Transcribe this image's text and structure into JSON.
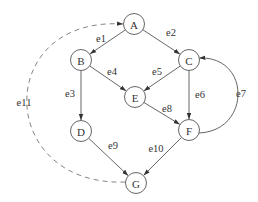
{
  "diagram": {
    "type": "directed-graph",
    "nodes": [
      {
        "id": "A",
        "label": "A",
        "x": 134,
        "y": 24
      },
      {
        "id": "B",
        "label": "B",
        "x": 81,
        "y": 60
      },
      {
        "id": "C",
        "label": "C",
        "x": 189,
        "y": 60
      },
      {
        "id": "E",
        "label": "E",
        "x": 135,
        "y": 97
      },
      {
        "id": "D",
        "label": "D",
        "x": 81,
        "y": 131
      },
      {
        "id": "F",
        "label": "F",
        "x": 189,
        "y": 130
      },
      {
        "id": "G",
        "label": "G",
        "x": 136,
        "y": 183
      }
    ],
    "edges": [
      {
        "id": "e1",
        "label": "e1",
        "from": "A",
        "to": "B",
        "style": "solid",
        "label_x": 101,
        "label_y": 38
      },
      {
        "id": "e2",
        "label": "e2",
        "from": "A",
        "to": "C",
        "style": "solid",
        "label_x": 171,
        "label_y": 32
      },
      {
        "id": "e3",
        "label": "e3",
        "from": "B",
        "to": "D",
        "style": "solid",
        "label_x": 70,
        "label_y": 93
      },
      {
        "id": "e4",
        "label": "e4",
        "from": "B",
        "to": "E",
        "style": "solid",
        "label_x": 112,
        "label_y": 71
      },
      {
        "id": "e5",
        "label": "e5",
        "from": "C",
        "to": "E",
        "style": "solid",
        "label_x": 157,
        "label_y": 71
      },
      {
        "id": "e6",
        "label": "e6",
        "from": "C",
        "to": "F",
        "style": "solid",
        "label_x": 200,
        "label_y": 94
      },
      {
        "id": "e7",
        "label": "e7",
        "from": "F",
        "to": "C",
        "style": "curved",
        "label_x": 241,
        "label_y": 93
      },
      {
        "id": "e8",
        "label": "e8",
        "from": "E",
        "to": "F",
        "style": "solid",
        "label_x": 167,
        "label_y": 108
      },
      {
        "id": "e9",
        "label": "e9",
        "from": "D",
        "to": "G",
        "style": "solid",
        "label_x": 113,
        "label_y": 145
      },
      {
        "id": "e10",
        "label": "e10",
        "from": "F",
        "to": "G",
        "style": "solid",
        "label_x": 156,
        "label_y": 148
      },
      {
        "id": "e11",
        "label": "e11",
        "from": "G",
        "to": "A",
        "style": "dashed-curved",
        "label_x": 24,
        "label_y": 102
      }
    ],
    "node_radius": 10.5,
    "colors": {
      "stroke": "#555555",
      "dashed_stroke": "#777777",
      "text": "#333333",
      "background": "#ffffff"
    }
  }
}
